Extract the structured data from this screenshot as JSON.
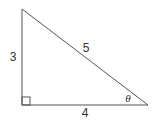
{
  "diagram": {
    "type": "right-triangle",
    "vertices": {
      "top": [
        22,
        9
      ],
      "right_angle": [
        22,
        105
      ],
      "acute": [
        148,
        105
      ]
    },
    "right_angle_marker_size": 8,
    "sides": {
      "vertical": {
        "label": "3",
        "pos": [
          13,
          61
        ]
      },
      "horizontal": {
        "label": "4",
        "pos": [
          85,
          117
        ]
      },
      "hypotenuse": {
        "label": "5",
        "pos": [
          86,
          52
        ]
      }
    },
    "angle": {
      "label": "θ",
      "pos": [
        128,
        102
      ]
    },
    "colors": {
      "stroke": "#555555",
      "text": "#333333",
      "background": "#ffffff"
    }
  }
}
